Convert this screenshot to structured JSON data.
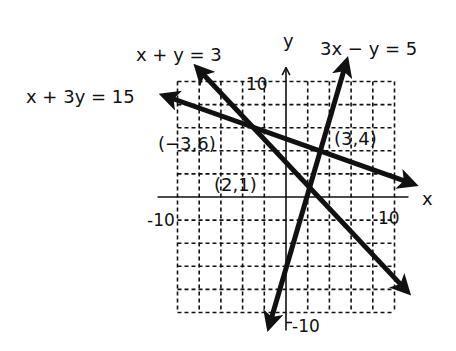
{
  "figure": {
    "axes": {
      "x_label": "x",
      "y_label": "y",
      "tick_labels": {
        "x_min": "-10",
        "x_max": "10",
        "y_max": "10",
        "y_min": "-10"
      },
      "range": {
        "x": [
          -10,
          10
        ],
        "y": [
          -10,
          10
        ]
      },
      "grid_step": 2,
      "grid_style": "dashed"
    },
    "lines": [
      {
        "id": "l1",
        "equation": "x + y = 3",
        "from": [
          -8,
          11
        ],
        "to": [
          11,
          -8
        ]
      },
      {
        "id": "l2",
        "equation": "x + 3y = 15",
        "from": [
          -11,
          8.7
        ],
        "to": [
          11.5,
          1.2
        ]
      },
      {
        "id": "l3",
        "equation": "3x − y = 5",
        "from": [
          -1.5,
          -11
        ],
        "to": [
          5.5,
          11.5
        ]
      }
    ],
    "points": [
      {
        "label": "(−3,6)",
        "x": -3,
        "y": 6
      },
      {
        "label": "(3,4)",
        "x": 3,
        "y": 4
      },
      {
        "label": "(2,1)",
        "x": 2,
        "y": 1
      }
    ],
    "colors": {
      "ink": "#111111",
      "background": "#ffffff"
    }
  }
}
